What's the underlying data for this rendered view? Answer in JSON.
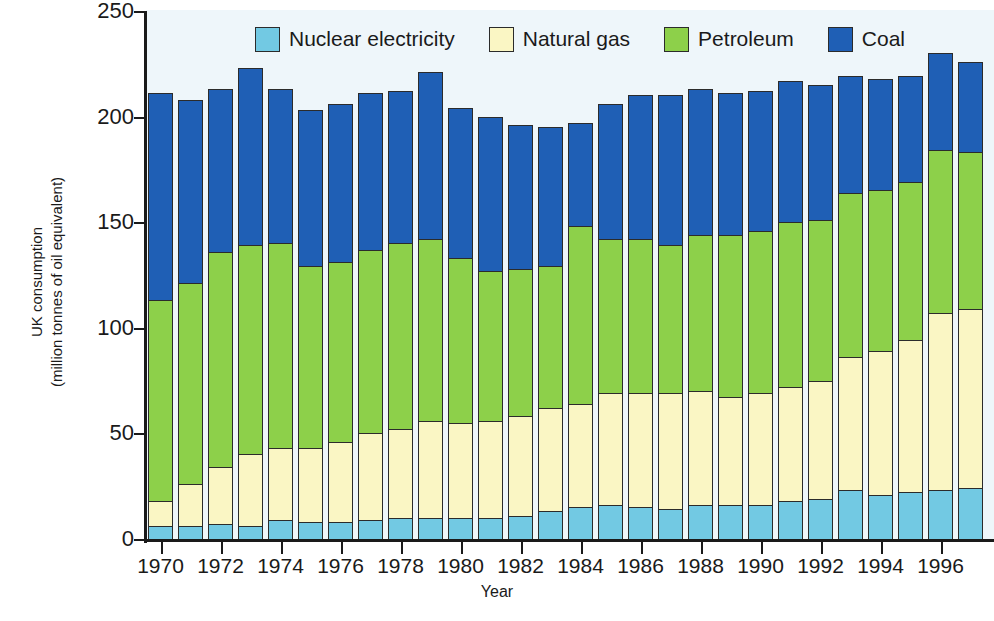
{
  "chart_data": {
    "type": "bar",
    "stacked": true,
    "title": "",
    "xlabel": "Year",
    "ylabel": "UK consumption (million tonnes of oil equivalent)",
    "ylabel_line1": "UK consumption",
    "ylabel_line2": "(million tonnes of oil equivalent)",
    "ylim": [
      0,
      250
    ],
    "yticks": [
      0,
      50,
      100,
      150,
      200,
      250
    ],
    "ytick_labels": [
      "0",
      "50",
      "100",
      "150",
      "200",
      "250"
    ],
    "xticks": [
      1970,
      1972,
      1974,
      1976,
      1978,
      1980,
      1982,
      1984,
      1986,
      1988,
      1990,
      1992,
      1994,
      1996
    ],
    "xtick_labels": [
      "1970",
      "1972",
      "1974",
      "1976",
      "1978",
      "1980",
      "1982",
      "1984",
      "1986",
      "1988",
      "1990",
      "1992",
      "1994",
      "1996"
    ],
    "grid": false,
    "legend_position": "top-center",
    "categories": [
      "1970",
      "1971",
      "1972",
      "1973",
      "1974",
      "1975",
      "1976",
      "1977",
      "1978",
      "1979",
      "1980",
      "1981",
      "1982",
      "1983",
      "1984",
      "1985",
      "1986",
      "1987",
      "1988",
      "1989",
      "1990",
      "1991",
      "1992",
      "1993",
      "1994",
      "1995",
      "1996",
      "1997"
    ],
    "series": [
      {
        "name": "Nuclear electricity",
        "color": "#72C9E3",
        "values": [
          7,
          7,
          8,
          7,
          10,
          9,
          9,
          10,
          11,
          11,
          11,
          11,
          12,
          14,
          16,
          17,
          16,
          15,
          17,
          17,
          17,
          19,
          20,
          24,
          22,
          23,
          24,
          25
        ]
      },
      {
        "name": "Natural gas",
        "color": "#FAF6C4",
        "values": [
          12,
          20,
          27,
          34,
          34,
          35,
          38,
          41,
          42,
          46,
          45,
          46,
          47,
          49,
          49,
          53,
          54,
          55,
          54,
          51,
          53,
          54,
          56,
          63,
          68,
          72,
          84,
          85
        ]
      },
      {
        "name": "Petroleum",
        "color": "#8DD04A",
        "values": [
          95,
          95,
          102,
          99,
          97,
          86,
          85,
          87,
          88,
          86,
          78,
          71,
          70,
          67,
          84,
          73,
          73,
          70,
          74,
          77,
          77,
          78,
          76,
          78,
          76,
          75,
          77,
          74
        ]
      },
      {
        "name": "Coal",
        "color": "#1F5FB5",
        "values": [
          98,
          87,
          77,
          84,
          73,
          74,
          75,
          74,
          72,
          79,
          71,
          73,
          68,
          66,
          49,
          64,
          68,
          71,
          69,
          67,
          66,
          67,
          64,
          55,
          53,
          50,
          46,
          43
        ]
      }
    ],
    "totals": [
      212,
      209,
      214,
      224,
      214,
      204,
      207,
      212,
      213,
      222,
      205,
      201,
      197,
      196,
      198,
      207,
      211,
      211,
      214,
      212,
      213,
      218,
      216,
      220,
      219,
      220,
      231,
      227
    ]
  },
  "legend": {
    "items": [
      {
        "label": "Nuclear electricity",
        "color": "#72C9E3"
      },
      {
        "label": "Natural gas",
        "color": "#FAF6C4"
      },
      {
        "label": "Petroleum",
        "color": "#8DD04A"
      },
      {
        "label": "Coal",
        "color": "#1F5FB5"
      }
    ]
  }
}
